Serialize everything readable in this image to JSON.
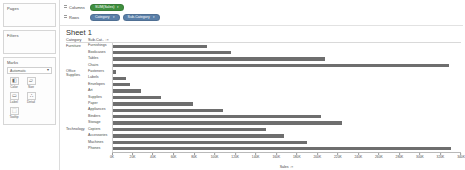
{
  "left_panel": {
    "pages": {
      "title": "Pages"
    },
    "filters": {
      "title": "Filters"
    },
    "marks": {
      "title": "Marks",
      "mark_type": "Automatic",
      "caret": "▾",
      "buttons": [
        {
          "label": "Color",
          "icon": "color-palette-icon",
          "glyph": "◧"
        },
        {
          "label": "Size",
          "icon": "size-icon",
          "glyph": "▱"
        },
        {
          "label": "Label",
          "icon": "label-icon",
          "glyph": "▭"
        },
        {
          "label": "Detail",
          "icon": "detail-icon",
          "glyph": "∴"
        },
        {
          "label": "Tooltip",
          "icon": "tooltip-icon",
          "glyph": "⬚"
        }
      ]
    }
  },
  "shelves": {
    "columns": {
      "label": "Columns",
      "pills": [
        {
          "text": "SUM(Sales)",
          "type": "measure",
          "caret": "▾"
        }
      ]
    },
    "rows": {
      "label": "Rows",
      "pills": [
        {
          "text": "Category",
          "type": "dimension",
          "caret": "▾"
        },
        {
          "text": "Sub-Category",
          "type": "dimension",
          "caret": "▾"
        }
      ]
    }
  },
  "sheet": {
    "title": "Sheet 1"
  },
  "table_headers": {
    "category": "Category",
    "sub_category": "Sub-Cat..",
    "sort_icon": "sort-descending-icon",
    "sort_glyph": "↓≡"
  },
  "categories": [
    {
      "name": "Furniture",
      "count": 4
    },
    {
      "name": "Office Supplies",
      "count": 9
    },
    {
      "name": "Technology",
      "count": 4
    }
  ],
  "axis_title": "Sales",
  "axis_sort_glyph": "↓≡",
  "chart_data": {
    "type": "bar",
    "orientation": "horizontal",
    "title": "Sheet 1",
    "xlabel": "Sales",
    "ylabel": "Sub-Category",
    "xlim": [
      0,
      340000
    ],
    "grid": false,
    "legend": "none",
    "bar_color": "#6e6e6e",
    "tick_labels": [
      "0K",
      "20K",
      "40K",
      "60K",
      "80K",
      "100K",
      "120K",
      "140K",
      "160K",
      "180K",
      "200K",
      "220K",
      "240K",
      "260K",
      "280K",
      "300K",
      "320K",
      "340K"
    ],
    "tick_values": [
      0,
      20000,
      40000,
      60000,
      80000,
      100000,
      120000,
      140000,
      160000,
      180000,
      200000,
      220000,
      240000,
      260000,
      280000,
      300000,
      320000,
      340000
    ],
    "categories": [
      "Furnishings",
      "Bookcases",
      "Tables",
      "Chairs",
      "Fasteners",
      "Labels",
      "Envelopes",
      "Art",
      "Supplies",
      "Paper",
      "Appliances",
      "Binders",
      "Storage",
      "Copiers",
      "Accessories",
      "Machines",
      "Phones"
    ],
    "values": [
      91705,
      114880,
      206966,
      328449,
      3024,
      12486,
      16476,
      27119,
      46674,
      78479,
      107532,
      203413,
      223844,
      149528,
      167380,
      189239,
      330007
    ],
    "groups": [
      {
        "name": "Furniture",
        "categories": [
          "Furnishings",
          "Bookcases",
          "Tables",
          "Chairs"
        ],
        "values": [
          91705,
          114880,
          206966,
          328449
        ]
      },
      {
        "name": "Office Supplies",
        "categories": [
          "Fasteners",
          "Labels",
          "Envelopes",
          "Art",
          "Supplies",
          "Paper",
          "Appliances",
          "Binders",
          "Storage"
        ],
        "values": [
          3024,
          12486,
          16476,
          27119,
          46674,
          78479,
          107532,
          203413,
          223844
        ]
      },
      {
        "name": "Technology",
        "categories": [
          "Copiers",
          "Accessories",
          "Machines",
          "Phones"
        ],
        "values": [
          149528,
          167380,
          189239,
          330007
        ]
      }
    ]
  }
}
